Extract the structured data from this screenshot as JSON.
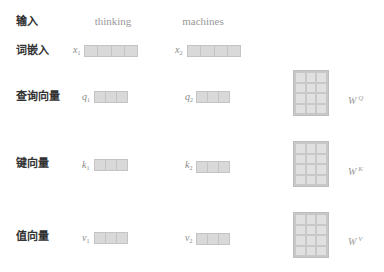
{
  "rows": {
    "input": "输入",
    "embedding": "词嵌入",
    "query": "查询向量",
    "key": "键向量",
    "value": "值向量"
  },
  "words": [
    "thinking",
    "machines"
  ],
  "vectors": {
    "embedding": [
      {
        "symbol": "x",
        "index": "1",
        "cells": 4
      },
      {
        "symbol": "x",
        "index": "2",
        "cells": 4
      }
    ],
    "query": [
      {
        "symbol": "q",
        "index": "1",
        "cells": 3
      },
      {
        "symbol": "q",
        "index": "2",
        "cells": 3
      }
    ],
    "key": [
      {
        "symbol": "k",
        "index": "1",
        "cells": 3
      },
      {
        "symbol": "k",
        "index": "2",
        "cells": 3
      }
    ],
    "value": [
      {
        "symbol": "v",
        "index": "1",
        "cells": 3
      },
      {
        "symbol": "v",
        "index": "2",
        "cells": 3
      }
    ]
  },
  "weights": {
    "query": {
      "symbol": "W",
      "sup": "Q",
      "rows": 4,
      "cols": 3
    },
    "key": {
      "symbol": "W",
      "sup": "K",
      "rows": 4,
      "cols": 3
    },
    "value": {
      "symbol": "W",
      "sup": "V",
      "rows": 4,
      "cols": 3
    }
  },
  "colors": {
    "cell_fill": "#d9d9d9",
    "cell_border": "#c4c4c4",
    "label_text": "#333333",
    "muted_text": "#999999"
  }
}
